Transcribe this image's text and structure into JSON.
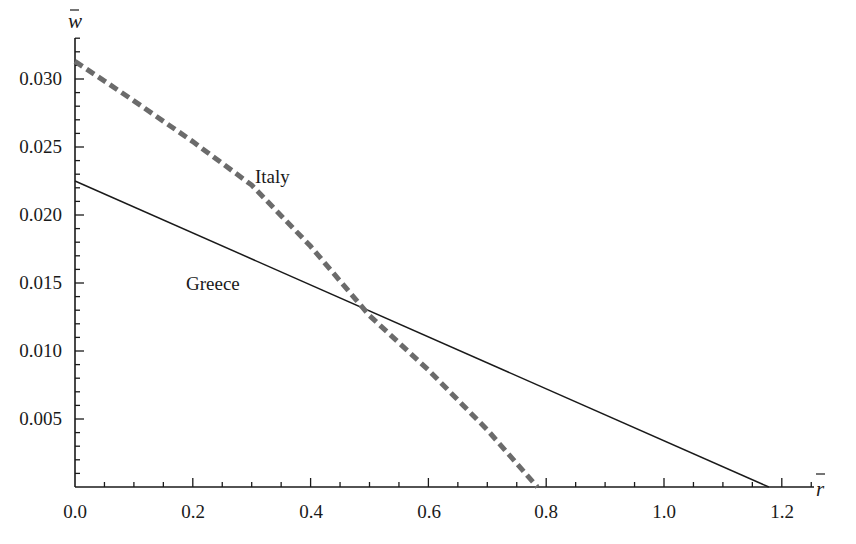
{
  "chart_data": {
    "type": "line",
    "title": "",
    "xlabel": "r̄",
    "ylabel": "w̄",
    "xlim": [
      0,
      1.25
    ],
    "ylim": [
      0,
      0.0335
    ],
    "grid": false,
    "legend": "inline labels",
    "x_ticks": [
      "0.0",
      "0.2",
      "0.4",
      "0.6",
      "0.8",
      "1.0",
      "1.2"
    ],
    "y_ticks": [
      "0.005",
      "0.010",
      "0.015",
      "0.020",
      "0.025",
      "0.030"
    ],
    "series": [
      {
        "name": "Italy",
        "style": "dashed",
        "color": "#6b6b6b",
        "x": [
          0.0,
          0.1,
          0.2,
          0.3,
          0.4,
          0.5,
          0.6,
          0.7,
          0.785
        ],
        "y": [
          0.0313,
          0.0284,
          0.0254,
          0.0222,
          0.0177,
          0.0126,
          0.0086,
          0.0042,
          0.0
        ]
      },
      {
        "name": "Greece",
        "style": "solid",
        "color": "#1a1a1a",
        "x": [
          0.0,
          1.178
        ],
        "y": [
          0.0225,
          0.0
        ]
      }
    ],
    "annotations": [
      {
        "text": "Italy",
        "x": 0.33,
        "y": 0.0238
      },
      {
        "text": "Greece",
        "x": 0.23,
        "y": 0.015
      }
    ]
  },
  "labels": {
    "x_axis_var": "r",
    "y_axis_var": "w",
    "italy": "Italy",
    "greece": "Greece",
    "x_ticks": [
      "0.0",
      "0.2",
      "0.4",
      "0.6",
      "0.8",
      "1.0",
      "1.2"
    ],
    "y_ticks": [
      "0.005",
      "0.010",
      "0.015",
      "0.020",
      "0.025",
      "0.030"
    ]
  }
}
